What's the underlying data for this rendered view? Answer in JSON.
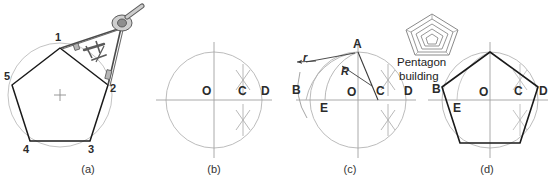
{
  "figure": {
    "background_color": "#ffffff",
    "line_color_object": "#1a1a1a",
    "line_color_construction": "#a8a8a8",
    "line_color_axis": "#9a9a9a",
    "text_color": "#2b2b2b"
  },
  "panels": [
    {
      "id": "a",
      "caption": "(a)",
      "description": "Pentagon drawn with a compass",
      "vertex_labels": [
        "1",
        "2",
        "3",
        "4",
        "5"
      ],
      "center_mark": "+",
      "tool": "compass-icon"
    },
    {
      "id": "b",
      "caption": "(b)",
      "description": "Circle with center O, axes, and bisection arcs locating C and D",
      "point_labels": [
        "O",
        "C",
        "D"
      ]
    },
    {
      "id": "c",
      "caption": "(c)",
      "description": "Arc of radius R from C through A locates E; arc r from A locates B",
      "point_labels": [
        "A",
        "B",
        "E",
        "O",
        "C",
        "D"
      ],
      "dimension_labels": [
        "r",
        "R"
      ]
    },
    {
      "id": "d",
      "caption": "(d)",
      "description": "Completed regular pentagon inscribed in the circle",
      "point_labels": [
        "B",
        "E",
        "O",
        "C",
        "D"
      ]
    }
  ],
  "callout": {
    "icon": "pentagon-building-icon",
    "line1": "Pentagon",
    "line2": "building"
  }
}
